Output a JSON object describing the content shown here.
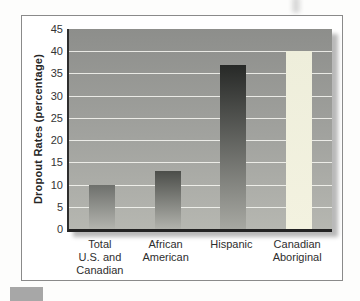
{
  "chart_data": {
    "type": "bar",
    "ylabel": "Dropout Rates (percentage)",
    "categories": [
      "Total\nU.S. and\nCanadian",
      "African\nAmerican",
      "Hispanic",
      "Canadian\nAboriginal"
    ],
    "values": [
      10,
      13,
      37,
      40
    ],
    "ylim": [
      0,
      45
    ],
    "ytick_step": 5,
    "ytick_labels": [
      "45",
      "40",
      "35",
      "30",
      "25",
      "20",
      "15",
      "10",
      "5",
      "0"
    ],
    "grid": "horizontal",
    "legend": "none",
    "colors": {
      "plot_bg_top": "#8d8e8b",
      "plot_bg_bottom": "#b6b7b1",
      "gridline": "#f4f4ef",
      "axis_line": "#2a2a2a",
      "frame_border": "#8a8a8a",
      "shadow": "#b9b9b9",
      "text": "#2e2e2e"
    },
    "bar_gradients": [
      [
        "#6e706c",
        "#b3b4ae"
      ],
      [
        "#4c4e4a",
        "#b1b2ac"
      ],
      [
        "#272927",
        "#a7a8a2"
      ],
      [
        "#eeeedb",
        "#f3f2e0"
      ]
    ]
  },
  "decorations": {
    "corner_tab_color": "#a7a7a7",
    "smudge_color": "#d9d9d9"
  }
}
